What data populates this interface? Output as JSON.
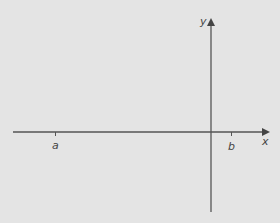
{
  "diagram": {
    "axes": {
      "x_label": "x",
      "y_label": "y"
    },
    "ticks": [
      {
        "label": "a",
        "position": "negative x-axis, far left"
      },
      {
        "label": "b",
        "position": "positive x-axis, just right of origin"
      }
    ],
    "colors": {
      "background": "#e4e4e4",
      "axis": "#555555",
      "text": "#444444"
    }
  }
}
